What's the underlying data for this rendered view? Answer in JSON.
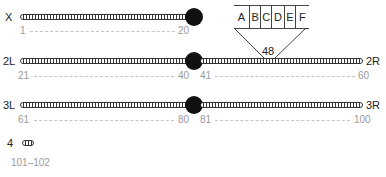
{
  "chromosomes": [
    {
      "id": "X",
      "left_label": "X",
      "right_label": "",
      "range_start": "1",
      "range_end": "20"
    },
    {
      "id": "2",
      "left_label": "2L",
      "right_label": "2R",
      "left_start": "21",
      "left_end": "40",
      "right_start": "41",
      "right_end": "60"
    },
    {
      "id": "3",
      "left_label": "3L",
      "right_label": "3R",
      "left_start": "61",
      "left_end": "80",
      "right_start": "81",
      "right_end": "100"
    },
    {
      "id": "4",
      "left_label": "4",
      "range": "101–102"
    }
  ],
  "zoom_inset": {
    "band": "48",
    "subdivisions": [
      "A",
      "B",
      "C",
      "D",
      "E",
      "F"
    ]
  },
  "colors": {
    "chromosome": "#333333",
    "centromere": "#111111",
    "range_text": "#9a9a9a"
  }
}
